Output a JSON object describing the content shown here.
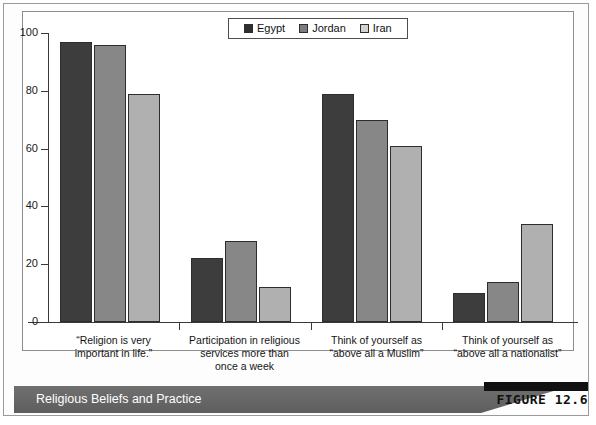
{
  "figure": {
    "banner_title": "Religious Beliefs and Practice",
    "figure_number": "FIGURE 12.6"
  },
  "chart_data": {
    "type": "bar",
    "title": "Religious Beliefs and Practice",
    "xlabel": "",
    "ylabel": "",
    "ylim": [
      0,
      100
    ],
    "yticks": [
      0,
      20,
      40,
      60,
      80,
      100
    ],
    "grid": false,
    "legend_position": "top-center",
    "categories": [
      "“Religion is very important in life.”",
      "Participation in religious services more than once a week",
      "Think of yourself as “above all a Muslim”",
      "Think of yourself as “above all a nationalist”"
    ],
    "category_lines": [
      [
        "“Religion is very",
        "important in life.”"
      ],
      [
        "Participation in religious",
        "services more than",
        "once a week"
      ],
      [
        "Think of yourself as",
        "“above all a Muslim”"
      ],
      [
        "Think of yourself as",
        "“above all a nationalist”"
      ]
    ],
    "series": [
      {
        "name": "Egypt",
        "color": "#3d3d3d",
        "values": [
          97,
          22,
          79,
          10
        ]
      },
      {
        "name": "Jordan",
        "color": "#878787",
        "values": [
          96,
          28,
          70,
          14
        ]
      },
      {
        "name": "Iran",
        "color": "#b0b0b0",
        "values": [
          79,
          12,
          61,
          34
        ]
      }
    ]
  },
  "legend": {
    "items": [
      {
        "label": "Egypt"
      },
      {
        "label": "Jordan"
      },
      {
        "label": "Iran"
      }
    ]
  }
}
